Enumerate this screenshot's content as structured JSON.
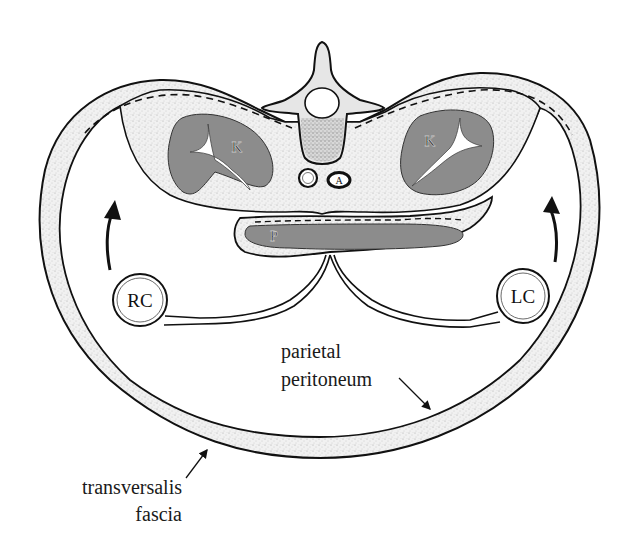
{
  "figure": {
    "colors": {
      "outline": "#111111",
      "stipple_fill": "#ececec",
      "organ_fill": "#8c8c8c",
      "vertebral_body_fill": "#cfcfcf",
      "background": "#ffffff"
    }
  },
  "labels": {
    "kidney_left": "K",
    "kidney_right": "K",
    "aorta": "A",
    "pancreas": "P",
    "right_colon": "RC",
    "left_colon": "LC",
    "parietal_peritoneum_line1": "parietal",
    "parietal_peritoneum_line2": "peritoneum",
    "transversalis_fascia_line1": "transversalis",
    "transversalis_fascia_line2": "fascia"
  },
  "structures": [
    {
      "name": "vertebra",
      "label": ""
    },
    {
      "name": "inferior-vena-cava",
      "label": ""
    },
    {
      "name": "aorta",
      "label": "A"
    },
    {
      "name": "left-kidney",
      "label": "K"
    },
    {
      "name": "right-kidney",
      "label": "K"
    },
    {
      "name": "pancreas",
      "label": "P"
    },
    {
      "name": "right-colon",
      "label": "RC"
    },
    {
      "name": "left-colon",
      "label": "LC"
    }
  ],
  "annotations": [
    {
      "text": "parietal peritoneum",
      "arrow": "points to inner lining of anterior wall"
    },
    {
      "text": "transversalis fascia",
      "arrow": "points to outer layer of anterior wall"
    }
  ],
  "arrows": [
    {
      "name": "right-colon-rotation-arrow",
      "direction": "up"
    },
    {
      "name": "left-colon-rotation-arrow",
      "direction": "up"
    }
  ]
}
